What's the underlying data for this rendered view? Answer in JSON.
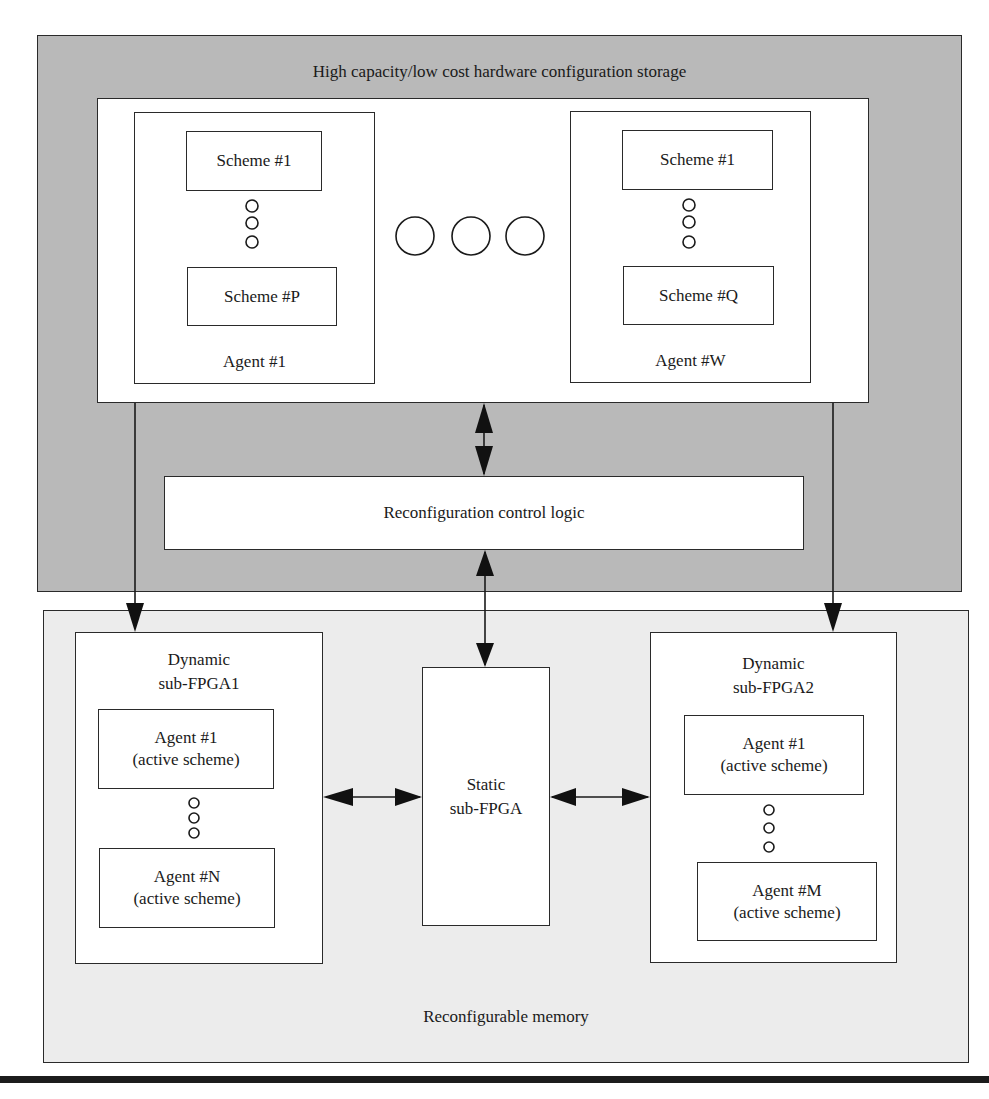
{
  "storage": {
    "title": "High capacity/low cost hardware configuration storage",
    "agents": [
      {
        "label": "Agent #1",
        "first_scheme": "Scheme #1",
        "last_scheme": "Scheme #P"
      },
      {
        "label": "Agent #W",
        "first_scheme": "Scheme #1",
        "last_scheme": "Scheme #Q"
      }
    ],
    "ellipsis_circles": 3
  },
  "control": {
    "label": "Reconfiguration control logic"
  },
  "memory": {
    "title": "Reconfigurable memory",
    "dynamic1": {
      "title_line1": "Dynamic",
      "title_line2": "sub-FPGA1",
      "first_agent": "Agent #1",
      "first_agent_sub": "(active scheme)",
      "last_agent": "Agent #N",
      "last_agent_sub": "(active scheme)"
    },
    "static": {
      "title_line1": "Static",
      "title_line2": "sub-FPGA"
    },
    "dynamic2": {
      "title_line1": "Dynamic",
      "title_line2": "sub-FPGA2",
      "first_agent": "Agent #1",
      "first_agent_sub": "(active scheme)",
      "last_agent": "Agent #M",
      "last_agent_sub": "(active scheme)"
    }
  },
  "colors": {
    "storage_bg": "#b9b9b9",
    "memory_bg": "#ececec",
    "line": "#1a1a1a"
  }
}
